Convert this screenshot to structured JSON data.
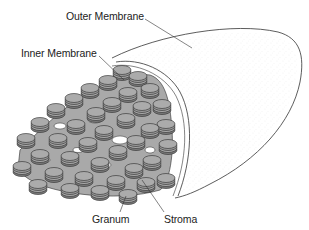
{
  "diagram": {
    "labels": {
      "outer_membrane": "Outer Membrane",
      "inner_membrane": "Inner Membrane",
      "granum": "Granum",
      "stroma": "Stroma"
    },
    "colors": {
      "outline": "#2a2a2a",
      "thylakoid_fill": "#a9a9a9",
      "thylakoid_shadow": "#6f6f6f",
      "stipple": "#c8c8c8",
      "background": "#ffffff"
    }
  }
}
